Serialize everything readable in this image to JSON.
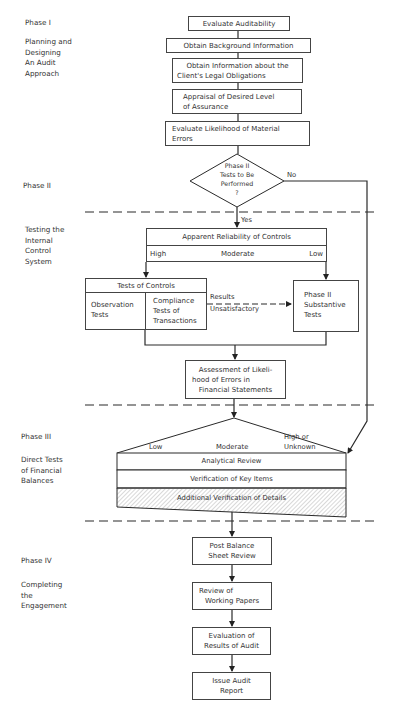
{
  "phases": [
    {
      "id": "phase1",
      "label": "Phase I",
      "description": [
        "Planning and",
        "Designing",
        "An Audit",
        "Approach"
      ]
    },
    {
      "id": "phase2",
      "label": "Phase II"
    },
    {
      "id": "phase2b",
      "description": [
        "Testing the",
        "Internal",
        "Control",
        "System"
      ]
    },
    {
      "id": "phase3",
      "label": "Phase III",
      "description": [
        "Direct Tests",
        "of Financial",
        "Balances"
      ]
    },
    {
      "id": "phase4",
      "label": "Phase IV",
      "description": [
        "Completing",
        "the",
        "Engagement"
      ]
    }
  ],
  "phase1_steps": [
    {
      "lines": [
        "Evaluate Auditability"
      ]
    },
    {
      "lines": [
        "Obtain Background Information"
      ]
    },
    {
      "lines": [
        "Obtain Information about the",
        "Client's Legal Obligations"
      ]
    },
    {
      "lines": [
        "Appraisal of Desired Level",
        "of Assurance"
      ]
    },
    {
      "lines": [
        "Evaluate Likelihood of Material",
        "Errors"
      ]
    }
  ],
  "decision": {
    "lines": [
      "Phase II",
      "Tests to Be",
      "Performed",
      "?"
    ],
    "yes_label": "Yes",
    "no_label": "No"
  },
  "reliability": {
    "title": "Apparent Reliability of Controls",
    "levels": [
      "High",
      "Moderate",
      "Low"
    ]
  },
  "tests_of_controls": {
    "title": "Tests of Controls",
    "left": [
      "Observation",
      "Tests"
    ],
    "right": [
      "Compliance",
      "Tests of",
      "Transactions"
    ]
  },
  "results_label": [
    "Results",
    "Unsatisfactory"
  ],
  "substantive": {
    "lines": [
      "Phase II",
      "Substantive",
      "Tests"
    ]
  },
  "assessment": {
    "lines": [
      "Assessment of Likeli-",
      "hood of Errors in",
      "Financial Statements"
    ]
  },
  "phase3_levels": [
    "Low",
    "Moderate",
    "High or",
    "Unknown"
  ],
  "phase3_rows": [
    "Analytical Review",
    "Verification of Key Items",
    "Additional Verification of Details"
  ],
  "phase4_steps": [
    {
      "lines": [
        "Post Balance",
        "Sheet Review"
      ]
    },
    {
      "lines": [
        "Review of",
        "Working Papers"
      ]
    },
    {
      "lines": [
        "Evaluation of",
        "Results of Audit"
      ]
    },
    {
      "lines": [
        "Issue Audit",
        "Report"
      ]
    }
  ],
  "colors": {
    "line": "#333333",
    "hatch": "#9a9a9a",
    "background": "#ffffff"
  }
}
